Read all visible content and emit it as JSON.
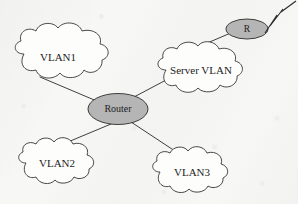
{
  "diagram": {
    "type": "network-topology",
    "background_color": "#f7f7f5",
    "line_color": "#2a2a2a",
    "cloud_fill": "#fdfdfc",
    "device_fill": "#b5b5b5",
    "text_color": "#1d1d1d",
    "nodes": [
      {
        "id": "vlan1",
        "label": "VLAN1",
        "shape": "cloud",
        "cx": 62,
        "cy": 58,
        "rx": 48,
        "ry": 23
      },
      {
        "id": "server-vlan",
        "label": "Server VLAN",
        "shape": "cloud",
        "cx": 202,
        "cy": 72,
        "rx": 45,
        "ry": 22
      },
      {
        "id": "router",
        "label": "Router",
        "shape": "ellipse",
        "cx": 118,
        "cy": 109,
        "rx": 29,
        "ry": 15,
        "fill": "#b5b5b5"
      },
      {
        "id": "r-device",
        "label": "R",
        "shape": "ellipse",
        "cx": 247,
        "cy": 29,
        "rx": 21,
        "ry": 10,
        "fill": "#b5b5b5"
      },
      {
        "id": "vlan2",
        "label": "VLAN2",
        "shape": "cloud",
        "cx": 62,
        "cy": 166,
        "rx": 42,
        "ry": 21
      },
      {
        "id": "vlan3",
        "label": "VLAN3",
        "shape": "cloud",
        "cx": 196,
        "cy": 175,
        "rx": 44,
        "ry": 21
      }
    ],
    "links": [
      {
        "id": "link-vlan1-router",
        "from": "vlan1",
        "to": "router",
        "x1": 40,
        "y1": 77,
        "x2": 97,
        "y2": 101
      },
      {
        "id": "link-router-server",
        "from": "router",
        "to": "server-vlan",
        "x1": 133,
        "y1": 97,
        "x2": 167,
        "y2": 78
      },
      {
        "id": "link-server-r",
        "from": "server-vlan",
        "to": "r-device",
        "x1": 178,
        "y1": 55,
        "x2": 232,
        "y2": 32
      },
      {
        "id": "link-router-vlan2",
        "from": "router",
        "to": "vlan2",
        "x1": 112,
        "y1": 124,
        "x2": 57,
        "y2": 148
      },
      {
        "id": "link-router-vlan3",
        "from": "router",
        "to": "vlan3",
        "x1": 131,
        "y1": 122,
        "x2": 180,
        "y2": 154
      }
    ],
    "wan_link": {
      "id": "wan-bolt",
      "name": "lightning-bolt",
      "description": "WAN lightning bolt leaving R toward upper right",
      "points": "263,32 276,14 269,25 282,8 291,3"
    }
  }
}
